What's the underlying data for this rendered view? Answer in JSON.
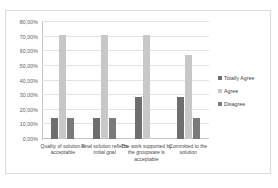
{
  "chart_data": {
    "type": "bar",
    "title": "",
    "subtitle": "",
    "xlabel": "",
    "ylabel": "",
    "grid": true,
    "legend_position": "right",
    "ylim": [
      0,
      80
    ],
    "ytick_labels": [
      "80,00%",
      "70,00%",
      "60,00%",
      "50,00%",
      "40,00%",
      "30,00%",
      "20,00%",
      "10,00%",
      "0,00%"
    ],
    "ytick_values": [
      80,
      70,
      60,
      50,
      40,
      30,
      20,
      10,
      0
    ],
    "categories": [
      "Quality of solution is acceptable",
      "Final solution reflects initial goal",
      "The work supported by the groupware is acceptable",
      "Committed to the solution"
    ],
    "series": [
      {
        "name": "Totally Agree",
        "color": "#6e6e6e",
        "values": [
          14.29,
          14.29,
          28.57,
          28.57
        ]
      },
      {
        "name": "Agree",
        "color": "#c8c8c8",
        "values": [
          71.43,
          71.43,
          71.43,
          57.14
        ]
      },
      {
        "name": "Disagree",
        "color": "#7a7a7a",
        "values": [
          14.29,
          14.29,
          0,
          14.29
        ]
      }
    ]
  }
}
